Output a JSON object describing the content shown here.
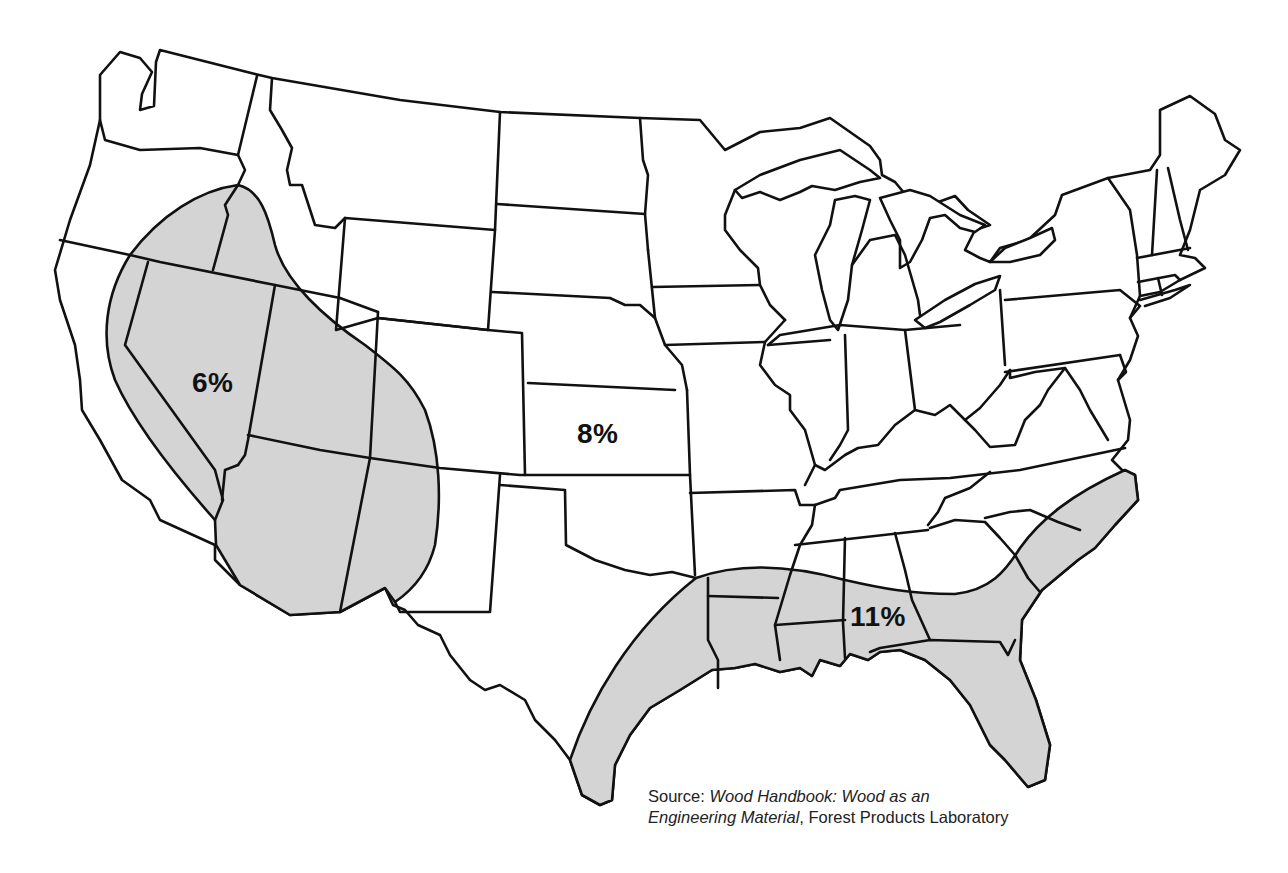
{
  "map": {
    "subject": "Contiguous United States — equilibrium moisture content zones",
    "colors": {
      "background": "#ffffff",
      "state_fill": "#ffffff",
      "zone_fill": "#d4d4d4",
      "outline": "#111111",
      "label_text": "#111111"
    },
    "zones": [
      {
        "id": "arid-west",
        "label": "6%",
        "shaded": true,
        "region": "Southwest / Great Basin (E Oregon, Nevada, Utah, Arizona, W New Mexico, SE California)"
      },
      {
        "id": "interior",
        "label": "8%",
        "shaded": false,
        "region": "Most of the country (label placed in Kansas)"
      },
      {
        "id": "gulf-coast",
        "label": "11%",
        "shaded": true,
        "region": "Gulf and South Atlantic coast (E Texas, Louisiana, Mississippi, Alabama, Georgia, Florida, S/N Carolina coast)"
      }
    ]
  },
  "source": {
    "prefix": "Source: ",
    "title_line1": "Wood Handbook: Wood as an",
    "title_line2": "Engineering Material",
    "suffix": ", Forest Products Laboratory"
  }
}
